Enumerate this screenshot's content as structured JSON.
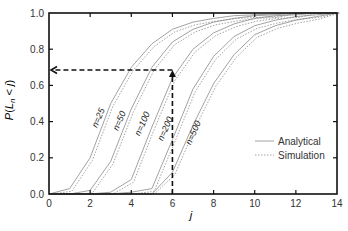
{
  "chart_data": {
    "type": "line",
    "title": "",
    "xlabel": "j",
    "ylabel": "P(L_n < j)",
    "xlim": [
      0,
      14
    ],
    "ylim": [
      0.0,
      1.0
    ],
    "x_ticks": [
      0,
      2,
      4,
      6,
      8,
      10,
      12,
      14
    ],
    "y_ticks": [
      0.0,
      0.2,
      0.4,
      0.6,
      0.8,
      1.0
    ],
    "x_tick_labels": [
      "0",
      "2",
      "4",
      "6",
      "8",
      "10",
      "12",
      "14"
    ],
    "y_tick_labels": [
      "0.0",
      "0.2",
      "0.4",
      "0.6",
      "0.8",
      "1.0"
    ],
    "grid": false,
    "legend": {
      "position": "lower right",
      "entries": [
        {
          "label": "Analytical",
          "style": "solid"
        },
        {
          "label": "Simulation",
          "style": "dotted"
        }
      ]
    },
    "x": [
      0,
      1,
      2,
      3,
      4,
      5,
      6,
      7,
      8,
      9,
      10,
      11,
      12,
      13,
      14
    ],
    "series": [
      {
        "name": "n=25",
        "label": "n=25",
        "values": [
          0.0,
          0.03,
          0.2,
          0.5,
          0.7,
          0.83,
          0.91,
          0.95,
          0.97,
          0.985,
          0.99,
          0.995,
          1.0,
          1.0,
          1.0
        ]
      },
      {
        "name": "n=50",
        "label": "n=50",
        "values": [
          0.0,
          0.0,
          0.02,
          0.18,
          0.47,
          0.7,
          0.84,
          0.91,
          0.95,
          0.97,
          0.985,
          0.99,
          1.0,
          1.0,
          1.0
        ]
      },
      {
        "name": "n=100",
        "label": "n=100",
        "values": [
          0.0,
          0.0,
          0.0,
          0.01,
          0.08,
          0.37,
          0.64,
          0.8,
          0.89,
          0.94,
          0.97,
          0.985,
          0.99,
          1.0,
          1.0
        ]
      },
      {
        "name": "n=200",
        "label": "n=200",
        "values": [
          0.0,
          0.0,
          0.0,
          0.0,
          0.01,
          0.03,
          0.3,
          0.58,
          0.76,
          0.87,
          0.93,
          0.96,
          0.98,
          0.99,
          1.0
        ]
      },
      {
        "name": "n=500",
        "label": "n=500",
        "values": [
          0.0,
          0.0,
          0.0,
          0.0,
          0.0,
          0.0,
          0.12,
          0.38,
          0.61,
          0.77,
          0.88,
          0.93,
          0.96,
          0.98,
          1.0
        ]
      }
    ],
    "annotations": [
      {
        "type": "dashed-arrow-vertical",
        "x": 6,
        "from_y": 0.0,
        "to_y": 0.685
      },
      {
        "type": "dashed-arrow-horizontal",
        "y": 0.685,
        "from_x": 6,
        "to_x": 0
      }
    ]
  },
  "labels": {
    "xlabel": "j",
    "ylabel_P": "P",
    "ylabel_open": "(",
    "ylabel_L": "L",
    "ylabel_n": "n",
    "ylabel_rest": " < ",
    "ylabel_j": "j",
    "ylabel_close": ")",
    "legend_analytical": "Analytical",
    "legend_simulation": "Simulation"
  },
  "style": {
    "axis_color": "#111111",
    "curve_color": "#8a8a8a",
    "annotation_color": "#111111"
  }
}
